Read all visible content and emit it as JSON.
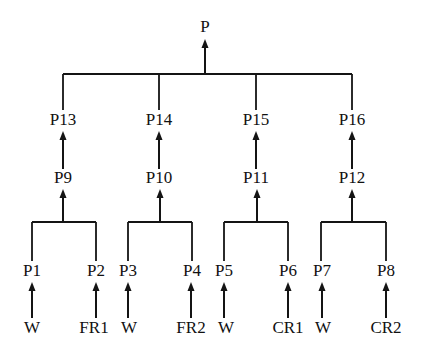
{
  "diagram": {
    "type": "fault-tree-hierarchy",
    "title": "",
    "background_color": "#ffffff",
    "line_color": "#141414",
    "text_color": "#111111",
    "nodes": [
      {
        "id": "P",
        "label": "P",
        "x": 205,
        "y": 28,
        "level": 0
      },
      {
        "id": "P13",
        "label": "P13",
        "x": 63,
        "y": 121,
        "level": 1
      },
      {
        "id": "P14",
        "label": "P14",
        "x": 159,
        "y": 121,
        "level": 1
      },
      {
        "id": "P15",
        "label": "P15",
        "x": 256,
        "y": 121,
        "level": 1
      },
      {
        "id": "P16",
        "label": "P16",
        "x": 352,
        "y": 121,
        "level": 1
      },
      {
        "id": "P9",
        "label": "P9",
        "x": 63,
        "y": 179,
        "level": 2
      },
      {
        "id": "P10",
        "label": "P10",
        "x": 159,
        "y": 179,
        "level": 2
      },
      {
        "id": "P11",
        "label": "P11",
        "x": 256,
        "y": 179,
        "level": 2
      },
      {
        "id": "P12",
        "label": "P12",
        "x": 352,
        "y": 179,
        "level": 2
      },
      {
        "id": "P1",
        "label": "P1",
        "x": 32,
        "y": 272,
        "level": 3
      },
      {
        "id": "P2",
        "label": "P2",
        "x": 96,
        "y": 272,
        "level": 3
      },
      {
        "id": "P3",
        "label": "P3",
        "x": 128,
        "y": 272,
        "level": 3
      },
      {
        "id": "P4",
        "label": "P4",
        "x": 192,
        "y": 272,
        "level": 3
      },
      {
        "id": "P5",
        "label": "P5",
        "x": 224,
        "y": 272,
        "level": 3
      },
      {
        "id": "P6",
        "label": "P6",
        "x": 288,
        "y": 272,
        "level": 3
      },
      {
        "id": "P7",
        "label": "P7",
        "x": 322,
        "y": 272,
        "level": 3
      },
      {
        "id": "P8",
        "label": "P8",
        "x": 386,
        "y": 272,
        "level": 3
      },
      {
        "id": "W1",
        "label": "W",
        "x": 32,
        "y": 329,
        "level": 4
      },
      {
        "id": "FR1",
        "label": "FR1",
        "x": 94,
        "y": 329,
        "level": 4
      },
      {
        "id": "W2",
        "label": "W",
        "x": 129,
        "y": 329,
        "level": 4
      },
      {
        "id": "FR2",
        "label": "FR2",
        "x": 191,
        "y": 329,
        "level": 4
      },
      {
        "id": "W3",
        "label": "W",
        "x": 226,
        "y": 329,
        "level": 4
      },
      {
        "id": "CR1",
        "label": "CR1",
        "x": 288,
        "y": 329,
        "level": 4
      },
      {
        "id": "W4",
        "label": "W",
        "x": 323,
        "y": 329,
        "level": 4
      },
      {
        "id": "CR2",
        "label": "CR2",
        "x": 386,
        "y": 329,
        "level": 4
      }
    ],
    "arrows": [
      {
        "name": "arrow-bus-to-P",
        "x": 205,
        "y_from": 74,
        "y_to": 39
      },
      {
        "name": "arrow-P9-to-P13",
        "x": 63,
        "y_from": 169,
        "y_to": 131
      },
      {
        "name": "arrow-P10-to-P14",
        "x": 159,
        "y_from": 169,
        "y_to": 131
      },
      {
        "name": "arrow-P11-to-P15",
        "x": 256,
        "y_from": 169,
        "y_to": 131
      },
      {
        "name": "arrow-P12-to-P16",
        "x": 352,
        "y_from": 169,
        "y_to": 131
      },
      {
        "name": "arrow-bus1-to-P9",
        "x": 63,
        "y_from": 222,
        "y_to": 189
      },
      {
        "name": "arrow-bus2-to-P10",
        "x": 160,
        "y_from": 222,
        "y_to": 189
      },
      {
        "name": "arrow-bus3-to-P11",
        "x": 257,
        "y_from": 222,
        "y_to": 189
      },
      {
        "name": "arrow-bus4-to-P12",
        "x": 352,
        "y_from": 222,
        "y_to": 189
      },
      {
        "name": "arrow-W1-to-P1",
        "x": 32,
        "y_from": 318,
        "y_to": 282
      },
      {
        "name": "arrow-FR1-to-P2",
        "x": 96,
        "y_from": 318,
        "y_to": 282
      },
      {
        "name": "arrow-W2-to-P3",
        "x": 128,
        "y_from": 318,
        "y_to": 282
      },
      {
        "name": "arrow-FR2-to-P4",
        "x": 191,
        "y_from": 318,
        "y_to": 282
      },
      {
        "name": "arrow-W3-to-P5",
        "x": 224,
        "y_from": 318,
        "y_to": 282
      },
      {
        "name": "arrow-CR1-to-P6",
        "x": 288,
        "y_from": 318,
        "y_to": 282
      },
      {
        "name": "arrow-W4-to-P7",
        "x": 322,
        "y_from": 318,
        "y_to": 282
      },
      {
        "name": "arrow-CR2-to-P8",
        "x": 386,
        "y_from": 318,
        "y_to": 282
      }
    ],
    "buses": [
      {
        "name": "bus-top-level1",
        "y": 74,
        "x_from": 63,
        "x_to": 352,
        "drops": [
          {
            "x": 63,
            "y_to": 110
          },
          {
            "x": 159,
            "y_to": 110
          },
          {
            "x": 256,
            "y_to": 110
          },
          {
            "x": 352,
            "y_to": 110
          }
        ]
      },
      {
        "name": "bus-P1-P2",
        "y": 222,
        "x_from": 32,
        "x_to": 96,
        "drops": [
          {
            "x": 32,
            "y_to": 261
          },
          {
            "x": 96,
            "y_to": 261
          }
        ]
      },
      {
        "name": "bus-P3-P4",
        "y": 222,
        "x_from": 128,
        "x_to": 192,
        "drops": [
          {
            "x": 128,
            "y_to": 261
          },
          {
            "x": 192,
            "y_to": 261
          }
        ]
      },
      {
        "name": "bus-P5-P6",
        "y": 222,
        "x_from": 224,
        "x_to": 288,
        "drops": [
          {
            "x": 224,
            "y_to": 261
          },
          {
            "x": 288,
            "y_to": 261
          }
        ]
      },
      {
        "name": "bus-P7-P8",
        "y": 222,
        "x_from": 321,
        "x_to": 386,
        "drops": [
          {
            "x": 321,
            "y_to": 261
          },
          {
            "x": 386,
            "y_to": 261
          }
        ]
      }
    ],
    "connections": [
      {
        "from": "P13",
        "to": "P"
      },
      {
        "from": "P14",
        "to": "P"
      },
      {
        "from": "P15",
        "to": "P"
      },
      {
        "from": "P16",
        "to": "P"
      },
      {
        "from": "P9",
        "to": "P13"
      },
      {
        "from": "P10",
        "to": "P14"
      },
      {
        "from": "P11",
        "to": "P15"
      },
      {
        "from": "P12",
        "to": "P16"
      },
      {
        "from": "P1",
        "to": "P9"
      },
      {
        "from": "P2",
        "to": "P9"
      },
      {
        "from": "P3",
        "to": "P10"
      },
      {
        "from": "P4",
        "to": "P10"
      },
      {
        "from": "P5",
        "to": "P11"
      },
      {
        "from": "P6",
        "to": "P11"
      },
      {
        "from": "P7",
        "to": "P12"
      },
      {
        "from": "P8",
        "to": "P12"
      },
      {
        "from": "W1",
        "to": "P1"
      },
      {
        "from": "FR1",
        "to": "P2"
      },
      {
        "from": "W2",
        "to": "P3"
      },
      {
        "from": "FR2",
        "to": "P4"
      },
      {
        "from": "W3",
        "to": "P5"
      },
      {
        "from": "CR1",
        "to": "P6"
      },
      {
        "from": "W4",
        "to": "P7"
      },
      {
        "from": "CR2",
        "to": "P8"
      }
    ]
  }
}
